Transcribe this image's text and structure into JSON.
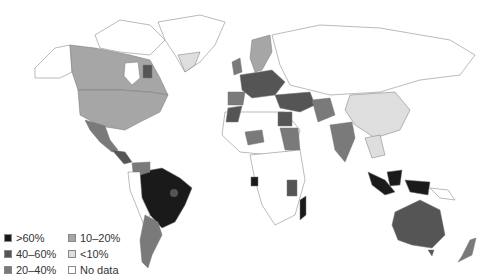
{
  "map": {
    "type": "choropleth",
    "projection": "world",
    "palette": {
      "gt60": "#1a1a1a",
      "p40_60": "#555555",
      "p20_40": "#7a7a7a",
      "p10_20": "#a6a6a6",
      "lt10": "#dedede",
      "nodata": "#ffffff"
    }
  },
  "legend": {
    "items": [
      {
        "key": "gt60",
        "label": ">60%",
        "color": "#1a1a1a"
      },
      {
        "key": "p10_20",
        "label": "10–20%",
        "color": "#a6a6a6"
      },
      {
        "key": "p40_60",
        "label": "40–60%",
        "color": "#555555"
      },
      {
        "key": "lt10",
        "label": "<10%",
        "color": "#dedede"
      },
      {
        "key": "p20_40",
        "label": "20–40%",
        "color": "#7a7a7a"
      },
      {
        "key": "nodata",
        "label": "No data",
        "color": "#ffffff"
      }
    ]
  }
}
